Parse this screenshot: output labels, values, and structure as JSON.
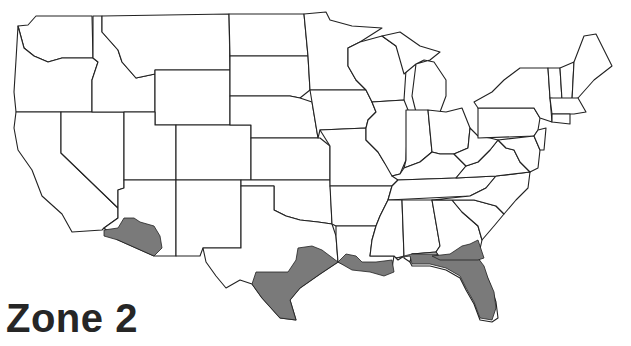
{
  "map": {
    "title": "Zone 2",
    "region": "Contiguous United States",
    "highlight_color": "#7a7a7a",
    "outline_color": "#222222",
    "background_color": "#ffffff",
    "highlighted_areas": [
      "Southern Arizona / southeastern California",
      "Southern and coastal Texas",
      "Southern Louisiana",
      "Gulf coast of Mississippi and Alabama",
      "Florida (except southern tip)",
      "Southern Georgia coast"
    ]
  }
}
